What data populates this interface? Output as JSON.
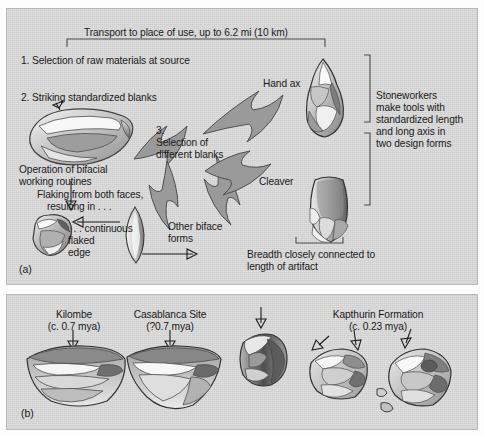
{
  "figure": {
    "panel_a": {
      "label": "(a)",
      "transport_note": "Transport to place of use, up to 6.2 mi (10 km)",
      "step1": "1. Selection of raw materials at source",
      "step2": "2. Striking standardized blanks",
      "step3_line1": "3.",
      "step3_line2": "Selection of",
      "step3_line3": "different blanks",
      "bifacial_line1": "Operation of bifacial",
      "bifacial_line2": "working routines",
      "flaking_line1": "Flaking from both faces,",
      "flaking_line2": "resulting in . . .",
      "continuous_line1": ". . . continuous",
      "continuous_line2": "flaked",
      "continuous_line3": "edge",
      "other_biface_line1": "Other biface",
      "other_biface_line2": "forms",
      "hand_ax_label": "Hand ax",
      "cleaver_label": "Cleaver",
      "stoneworkers_line1": "Stoneworkers",
      "stoneworkers_line2": "make tools with",
      "stoneworkers_line3": "standardized length",
      "stoneworkers_line4": "and long axis in",
      "stoneworkers_line5": "two design forms",
      "breadth_line1": "Breadth closely connected to",
      "breadth_line2": "length of artifact"
    },
    "panel_b": {
      "label": "(b)",
      "sites": [
        {
          "name": "Kilombe",
          "date": "(c. 0.7 mya)"
        },
        {
          "name": "Casablanca Site",
          "date": "(?0.7 mya)"
        },
        {
          "name": "Kapthurin Formation",
          "date": "(c. 0.23 mya)"
        }
      ]
    }
  },
  "colors": {
    "panel_background": "#d4d4d4",
    "page_background": "#fdfdfd",
    "panel_border": "#b9b9b9",
    "arrow_fill": "#9a9a9a",
    "arrow_stroke": "#4e4e4e",
    "text": "#1a1a1a",
    "artifact_light": "#f2f2f2",
    "artifact_mid": "#b5b5b5",
    "artifact_dark": "#6e6e6e"
  }
}
